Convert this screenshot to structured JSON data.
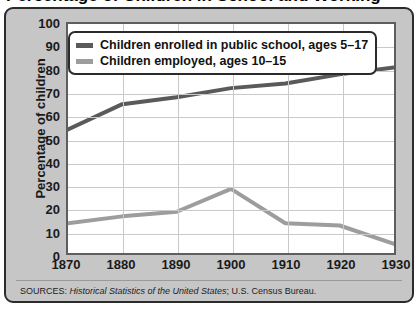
{
  "figure": {
    "cutoff_title": "Percentage of Children in School and Working",
    "source_prefix": "SOURCES:",
    "source_italic": "Historical Statistics of the United States",
    "source_suffix": "; U.S. Census Bureau."
  },
  "legend": {
    "items": [
      {
        "label": "Children enrolled in public school, ages 5–17",
        "color": "#5a5a5a"
      },
      {
        "label": "Children employed, ages 10–15",
        "color": "#9d9d9d"
      }
    ]
  },
  "colors": {
    "enrolled_line": "#5a5a5a",
    "employed_line": "#9d9d9d",
    "frame_background": "#c6c6c6",
    "frame_border": "#2b2b2b",
    "plot_background": "#ffffff",
    "plot_border": "#5e5e5e",
    "gridline": "#c9c9c9",
    "text": "#1a1a1a"
  },
  "chart_data": {
    "type": "line",
    "title": "Percentage of Children in School and Working",
    "xlabel": "",
    "ylabel": "Percentage of children",
    "categories": [
      "1870",
      "1880",
      "1890",
      "1900",
      "1910",
      "1920",
      "1930"
    ],
    "x": [
      1870,
      1880,
      1890,
      1900,
      1910,
      1920,
      1930
    ],
    "xlim": [
      1870,
      1930
    ],
    "ylim": [
      0,
      100
    ],
    "yticks": [
      0,
      10,
      20,
      30,
      40,
      50,
      60,
      70,
      80,
      90,
      100
    ],
    "xticks": [
      1870,
      1880,
      1890,
      1900,
      1910,
      1920,
      1930
    ],
    "grid": true,
    "legend_position": "top-left",
    "series": [
      {
        "name": "Children enrolled in public school, ages 5–17",
        "color": "#5a5a5a",
        "values": [
          54,
          65,
          68,
          72,
          74,
          78,
          81
        ]
      },
      {
        "name": "Children employed, ages 10–15",
        "color": "#9d9d9d",
        "values": [
          13,
          16,
          18,
          28,
          13,
          12,
          4
        ]
      }
    ],
    "annotations": [
      "SOURCES: Historical Statistics of the United States; U.S. Census Bureau."
    ]
  }
}
